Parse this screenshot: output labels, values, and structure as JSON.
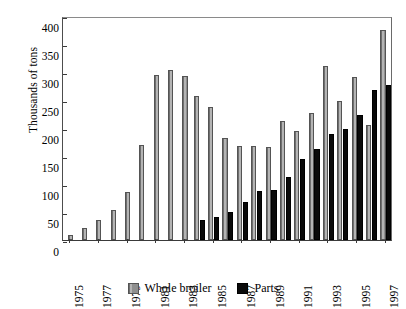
{
  "chart_data": {
    "type": "bar",
    "title": "",
    "subtitle": "",
    "xlabel": "",
    "ylabel": "Thousands of tons",
    "ylim": [
      0,
      400
    ],
    "yticks": [
      0,
      50,
      100,
      150,
      200,
      250,
      300,
      350,
      400
    ],
    "grid": false,
    "legend_position": "bottom",
    "categories": [
      "1975",
      "1976",
      "1977",
      "1978",
      "1979",
      "1980",
      "1981",
      "1982",
      "1983",
      "1984",
      "1985",
      "1986",
      "1987",
      "1988",
      "1989",
      "1990",
      "1991",
      "1992",
      "1993",
      "1994",
      "1995",
      "1996",
      "1997"
    ],
    "xtick_labels": [
      "1975",
      "1977",
      "1979",
      "1981",
      "1983",
      "1985",
      "1987",
      "1989",
      "1991",
      "1993",
      "1995",
      "1997"
    ],
    "series": [
      {
        "name": "Whole broiler",
        "color": "#8f8f8f",
        "values": [
          9,
          21,
          36,
          54,
          85,
          170,
          295,
          304,
          292,
          258,
          238,
          182,
          168,
          168,
          166,
          213,
          195,
          226,
          311,
          248,
          291,
          206,
          375
        ]
      },
      {
        "name": "Parts",
        "color": "#0a0a0a",
        "values": [
          0,
          0,
          0,
          0,
          0,
          0,
          0,
          0,
          0,
          35,
          41,
          50,
          67,
          88,
          90,
          113,
          145,
          162,
          190,
          198,
          223,
          268,
          277
        ]
      }
    ]
  },
  "legend": {
    "items": [
      {
        "label": "Whole broiler",
        "swatch": "gray-swatch-icon"
      },
      {
        "label": "Parts",
        "swatch": "black-swatch-icon"
      }
    ]
  }
}
